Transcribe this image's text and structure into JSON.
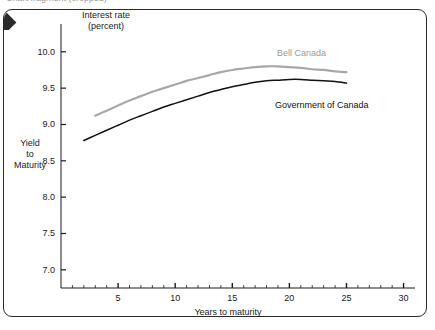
{
  "top_sliver_text": "Chart fragment (cropped)",
  "header": {
    "line1": "Interest rate",
    "line2": "(percent)"
  },
  "y_axis_title": {
    "line1": "Yield",
    "line2": "to",
    "line3": "Maturity"
  },
  "x_axis_title": "Years to maturity",
  "colors": {
    "bell_canada": "#a8a8a8",
    "government_of_canada": "#111111",
    "axis": "#1a1a1a",
    "frame": "#2b2b2b"
  },
  "chart_data": {
    "type": "line",
    "title": "Interest rate (percent)",
    "subtitle": "",
    "xlabel": "Years to maturity",
    "ylabel": "Yield to Maturity",
    "xlim": [
      0,
      31
    ],
    "ylim": [
      6.75,
      10.3
    ],
    "xticks": [
      5,
      10,
      15,
      20,
      25,
      30
    ],
    "xtick_labels": [
      "5",
      "10",
      "15",
      "20",
      "25",
      "30"
    ],
    "x_minor_tick_step": 1,
    "yticks": [
      7.0,
      7.5,
      8.0,
      8.5,
      9.0,
      9.5,
      10.0
    ],
    "ytick_labels": [
      "7.0",
      "7.5",
      "8.0",
      "8.5",
      "9.0",
      "9.5",
      "10.0"
    ],
    "grid": false,
    "legend": "inline-annotations",
    "series": [
      {
        "name": "Bell Canada",
        "color": "#a8a8a8",
        "label_position": "above-right",
        "x": [
          3,
          4,
          5,
          6,
          7,
          8,
          9,
          10,
          11,
          12,
          13,
          14,
          15,
          16,
          17,
          18,
          19,
          20,
          21,
          22,
          23,
          24,
          25
        ],
        "y": [
          9.12,
          9.19,
          9.26,
          9.33,
          9.39,
          9.45,
          9.5,
          9.55,
          9.6,
          9.64,
          9.68,
          9.72,
          9.75,
          9.77,
          9.79,
          9.8,
          9.8,
          9.79,
          9.78,
          9.76,
          9.75,
          9.73,
          9.72
        ]
      },
      {
        "name": "Government of Canada",
        "color": "#111111",
        "label_position": "below-right",
        "x": [
          2,
          3,
          4,
          5,
          6,
          7,
          8,
          9,
          10,
          11,
          12,
          13,
          14,
          15,
          16,
          17,
          18,
          19,
          20,
          21,
          22,
          23,
          24,
          25
        ],
        "y": [
          8.78,
          8.85,
          8.92,
          8.99,
          9.06,
          9.12,
          9.18,
          9.24,
          9.29,
          9.34,
          9.39,
          9.44,
          9.48,
          9.52,
          9.55,
          9.58,
          9.6,
          9.61,
          9.62,
          9.62,
          9.61,
          9.6,
          9.59,
          9.57
        ]
      }
    ],
    "annotations": [
      {
        "text": "Bell Canada",
        "series": "Bell Canada"
      },
      {
        "text": "Government of Canada",
        "series": "Government of Canada"
      }
    ]
  }
}
